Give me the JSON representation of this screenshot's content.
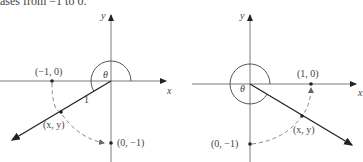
{
  "caption": "ases from −1 to 0.",
  "left_diagram": {
    "y_axis_label": "y",
    "x_axis_label": "x",
    "angle_label": "θ",
    "radius_label": "1",
    "point_start_label": "(−1, 0)",
    "point_mid_label": "(x, y)",
    "point_end_label": "(0, −1)"
  },
  "right_diagram": {
    "y_axis_label": "y",
    "x_axis_label": "x",
    "angle_label": "θ",
    "point_start_label": "(1, 0)",
    "point_mid_label": "(x, y)",
    "point_end_label": "(0, −1)"
  },
  "colors": {
    "axis": "#7a7a7a",
    "ray": "#222222",
    "dashed": "#888888",
    "arc": "#555555",
    "point": "#222222"
  }
}
